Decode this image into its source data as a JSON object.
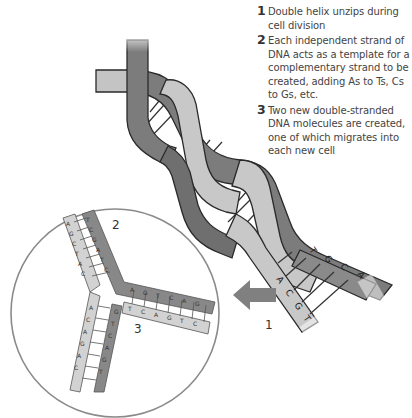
{
  "steps": [
    {
      "number": "1",
      "text": "Double helix unzips during cell division"
    },
    {
      "number": "2",
      "text": "Each independent strand of DNA acts as a template for a complementary strand to be created, adding As to Ts, Cs to Gs, etc."
    },
    {
      "number": "3",
      "text": "Two new double-stranded DNA molecules are created, one of which migrates into each new cell"
    }
  ],
  "diagram_labels": {
    "unzip_point": "1",
    "new_strand_upper": "2",
    "new_strand_lower": "3"
  },
  "helix_bases": {
    "light_strand": [
      "A",
      "C",
      "G",
      "T"
    ],
    "dark_strand": [
      "T",
      "G",
      "C",
      "A"
    ]
  },
  "colors": {
    "dark_strand": "#7a7a7a",
    "light_strand": "#c6c6c6",
    "outline": "#2a2a2a",
    "arrow": "#808080",
    "circle": "#8a8a8a"
  }
}
